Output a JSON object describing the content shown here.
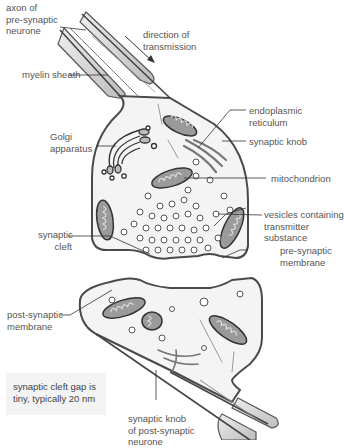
{
  "diagram": {
    "labels": {
      "axon": [
        "axon of",
        "pre-synaptic",
        "neurone"
      ],
      "direction": [
        "direction of",
        "transmission"
      ],
      "myelin": "myelin sheath",
      "golgi": [
        "Golgi",
        "apparatus"
      ],
      "er": [
        "endoplasmic",
        "reticulum"
      ],
      "synaptic_knob": "synaptic knob",
      "mitochondrion": "mitochondrion",
      "vesicles": [
        "vesicles containing",
        "transmitter",
        "substance"
      ],
      "pre_membrane": [
        "pre-synaptic",
        "membrane"
      ],
      "cleft": [
        "synaptic",
        "cleft"
      ],
      "post_membrane": [
        "post-synaptic",
        "membrane"
      ],
      "post_knob": [
        "synaptic knob",
        "of post-synaptic",
        "neurone"
      ]
    },
    "note": [
      "synaptic cleft gap is",
      "tiny, typically 20 nm"
    ],
    "colors": {
      "outline": "#4a4a4a",
      "cytoplasm": "#f4f4f4",
      "organelle": "#9a9a9a",
      "myelin": "#d8d8d8",
      "label_text": "#555555",
      "note_bg": "#f3f3f3"
    }
  }
}
